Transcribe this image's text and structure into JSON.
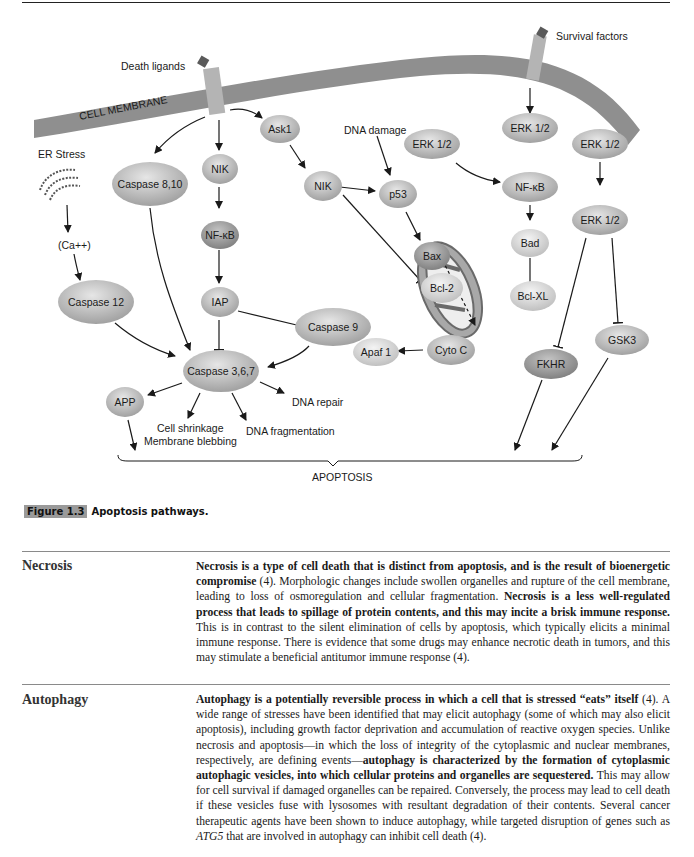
{
  "figure": {
    "membrane_label": "CELL MEMBRANE",
    "labels": {
      "death_ligands": "Death ligands",
      "survival_factors": "Survival factors",
      "er_stress": "ER Stress",
      "calcium": "(Ca++)",
      "dna_damage": "DNA damage",
      "dna_repair": "DNA repair",
      "cell_shrinkage": "Cell shrinkage",
      "membrane_blebbing": "Membrane blebbing",
      "dna_fragmentation": "DNA fragmentation",
      "apoptosis": "APOPTOSIS"
    },
    "nodes": {
      "ask1": "Ask1",
      "caspase_8_10": "Caspase 8,10",
      "nik_left": "NIK",
      "nfkb_left": "NF-κB",
      "iap": "IAP",
      "caspase_12": "Caspase 12",
      "caspase_367": "Caspase 3,6,7",
      "app": "APP",
      "nik_mid": "NIK",
      "p53": "p53",
      "bax": "Bax",
      "bcl2": "Bcl-2",
      "caspase_9": "Caspase 9",
      "apaf1": "Apaf 1",
      "cyto_c": "Cyto C",
      "erk_a": "ERK 1/2",
      "erk_b": "ERK 1/2",
      "nfkb_right": "NF-κB",
      "bad": "Bad",
      "bclxl": "Bcl-XL",
      "erk_c": "ERK 1/2",
      "erk_d": "ERK 1/2",
      "fkhr": "FKHR",
      "gsk3": "GSK3"
    },
    "colors": {
      "membrane": "#8f8f8f",
      "receptor": "#b4b4b4",
      "ligand": "#5a5a5a",
      "node_light": "#d4d4d4",
      "node_mid": "#b8b8b8",
      "node_dark": "#9a9a9a"
    }
  },
  "caption": {
    "label": "Figure 1.3",
    "text": "Apoptosis pathways."
  },
  "sections": [
    {
      "heading": "Necrosis",
      "paragraph": [
        {
          "b": true,
          "t": "Necrosis is a type of cell death that is distinct from apoptosis, and is the result of bioenergetic compromise"
        },
        {
          "b": false,
          "t": " (4). Morphologic changes include swollen organelles and rupture of the cell membrane, leading to loss of osmoregulation and cellular fragmentation. "
        },
        {
          "b": true,
          "t": "Necrosis is a less well-regulated process that leads to spillage of protein contents, and this may incite a brisk immune response."
        },
        {
          "b": false,
          "t": " This is in contrast to the silent elimination of cells by apoptosis, which typically elicits a minimal immune response. There is evidence that some drugs may enhance necrotic death in tumors, and this may stimulate a beneficial antitumor immune response (4)."
        }
      ]
    },
    {
      "heading": "Autophagy",
      "paragraph": [
        {
          "b": true,
          "t": "Autophagy is a potentially reversible process in which a cell that is stressed “eats” itself"
        },
        {
          "b": false,
          "t": " (4). A wide range of stresses have been identified that may elicit autophagy (some of which may also elicit apoptosis), including growth factor deprivation and accumulation of reactive oxygen species. Unlike necrosis and apoptosis—in which the loss of integrity of the cytoplasmic and nuclear membranes, respectively, are defining events—"
        },
        {
          "b": true,
          "t": "autophagy is characterized by the formation of cytoplasmic autophagic vesicles, into which cellular proteins and organelles are sequestered."
        },
        {
          "b": false,
          "t": " This may allow for cell survival if damaged organelles can be repaired. Conversely, the process may lead to cell death if these vesicles fuse with lysosomes with resultant degradation of their contents. Several cancer therapeutic agents have been shown to induce autophagy, while targeted disruption of genes such as "
        },
        {
          "b": false,
          "i": true,
          "t": "ATG5"
        },
        {
          "b": false,
          "t": " that are involved in autophagy can inhibit cell death (4)."
        }
      ]
    }
  ]
}
